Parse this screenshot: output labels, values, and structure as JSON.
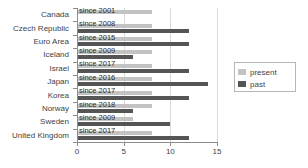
{
  "chart_data": {
    "type": "bar",
    "orientation": "horizontal",
    "title": "",
    "xlabel": "",
    "ylabel": "",
    "xlim": [
      0,
      15
    ],
    "xticks": [
      "0",
      "5",
      "10",
      "15"
    ],
    "xtick_values": [
      0,
      5,
      10,
      15
    ],
    "grid": true,
    "legend_position": "right",
    "categories": [
      "Canada",
      "Czech Republic",
      "Euro Area",
      "Iceland",
      "Israel",
      "Japan",
      "Korea",
      "Norway",
      "Sweden",
      "United Kingdom"
    ],
    "annotations": [
      "since 2001",
      "since 2008",
      "since 2015",
      "since 2009",
      "since 2017",
      "since 2016",
      "since 2017",
      "since 2018",
      "since 2009",
      "since 2017"
    ],
    "series": [
      {
        "name": "present",
        "color": "#c3c3c3",
        "values": [
          8,
          8,
          8,
          8,
          8,
          8,
          8,
          8,
          6,
          8
        ]
      },
      {
        "name": "past",
        "color": "#555555",
        "values": [
          0,
          12,
          12,
          6,
          12,
          14,
          12,
          6,
          10,
          12
        ]
      }
    ]
  },
  "legend": {
    "items": [
      {
        "label": "present",
        "color": "#c3c3c3"
      },
      {
        "label": "past",
        "color": "#555555"
      }
    ]
  },
  "colors": {
    "present": "#c3c3c3",
    "past": "#555555",
    "axis": "#8c8c8c",
    "grid": "#d9d9d9",
    "text": "#3f3f3f",
    "background": "#ffffff"
  }
}
